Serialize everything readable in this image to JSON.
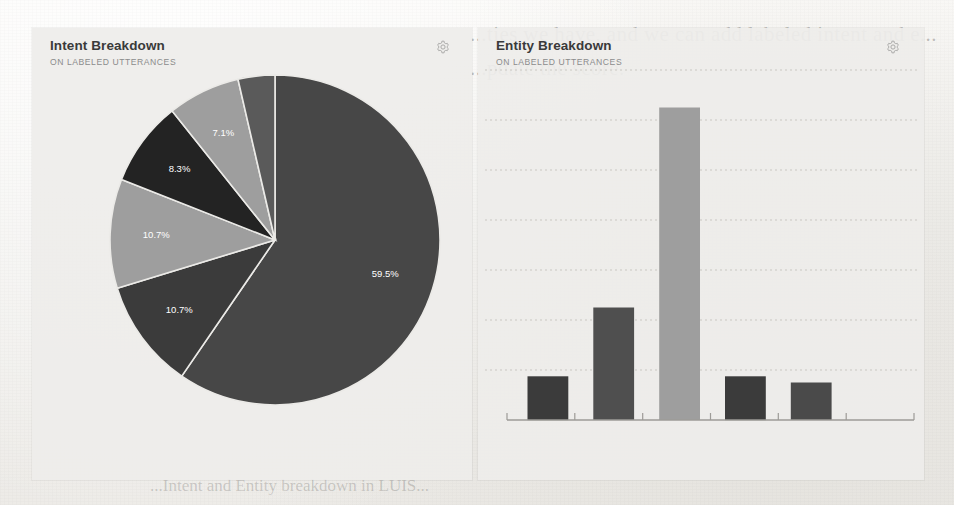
{
  "page": {
    "background_color": "#f0efec",
    "ghost_text_line_1": "...ties we have, and we can add labeled intent and e...",
    "ghost_text_line_2": "...pdate the score.",
    "ghost_text_line_3": "...Intent and Entity breakdown in LUIS..."
  },
  "panels": [
    {
      "id": "intent-breakdown",
      "title": "Intent Breakdown",
      "subtitle": "ON LABELED UTTERANCES",
      "settings_icon": "gear-icon",
      "settings_label": "Settings"
    },
    {
      "id": "entity-breakdown",
      "title": "Entity Breakdown",
      "subtitle": "ON LABELED UTTERANCES",
      "settings_icon": "gear-icon",
      "settings_label": "Settings"
    }
  ],
  "chart_data": [
    {
      "type": "pie",
      "title": "Intent Breakdown",
      "subtitle": "ON LABELED UTTERANCES",
      "xlabel": "",
      "ylabel": "",
      "legend": false,
      "grid": false,
      "start_angle_deg": 0,
      "direction": "clockwise",
      "center": [
        275,
        240
      ],
      "radius": 165,
      "labels": [
        "59.5%",
        "10.7%",
        "10.7%",
        "8.3%",
        "7.1%",
        "3.6%"
      ],
      "values": [
        59.5,
        10.7,
        10.7,
        8.3,
        7.1,
        3.6
      ],
      "label_visible": [
        true,
        true,
        true,
        true,
        true,
        false
      ],
      "colors": [
        "#474747",
        "#3b3b3b",
        "#9e9e9e",
        "#232323",
        "#9e9e9e",
        "#5a5a5a"
      ],
      "slices": [
        {
          "label": "59.5%",
          "value": 59.5,
          "color": "#474747",
          "show_label": true
        },
        {
          "label": "10.7%",
          "value": 10.7,
          "color": "#3b3b3b",
          "show_label": true
        },
        {
          "label": "10.7%",
          "value": 10.7,
          "color": "#9e9e9e",
          "show_label": true
        },
        {
          "label": "8.3%",
          "value": 8.3,
          "color": "#232323",
          "show_label": true
        },
        {
          "label": "7.1%",
          "value": 7.1,
          "color": "#9e9e9e",
          "show_label": true
        },
        {
          "label": "3.6%",
          "value": 3.6,
          "color": "#5a5a5a",
          "show_label": false
        }
      ]
    },
    {
      "type": "bar",
      "title": "Entity Breakdown",
      "subtitle": "ON LABELED UTTERANCES",
      "xlabel": "",
      "ylabel": "",
      "legend": false,
      "grid": true,
      "grid_lines": 7,
      "ylim": [
        0,
        56
      ],
      "categories": [
        "1",
        "2",
        "3",
        "4",
        "5",
        "6"
      ],
      "tick_labels": [
        "",
        "",
        "",
        "",
        "",
        "",
        ""
      ],
      "values": [
        7,
        18,
        50,
        7,
        6,
        0
      ],
      "colors": [
        "#3b3b3b",
        "#4f4f4f",
        "#9e9e9e",
        "#3b3b3b",
        "#4a4a4a",
        "#000000"
      ],
      "bars": [
        {
          "category": "1",
          "value": 7,
          "color": "#3b3b3b"
        },
        {
          "category": "2",
          "value": 18,
          "color": "#4f4f4f"
        },
        {
          "category": "3",
          "value": 50,
          "color": "#9e9e9e"
        },
        {
          "category": "4",
          "value": 7,
          "color": "#3b3b3b"
        },
        {
          "category": "5",
          "value": 6,
          "color": "#4a4a4a"
        }
      ]
    }
  ]
}
